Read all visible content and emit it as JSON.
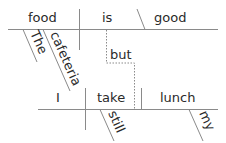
{
  "diagram": {
    "type": "sentence-diagram",
    "clause1": {
      "subject": "food",
      "verb": "is",
      "complement": "good",
      "modifiers": [
        "The",
        "cafeteria"
      ]
    },
    "conjunction": "but",
    "clause2": {
      "subject": "I",
      "verb": "take",
      "object": "lunch",
      "verb_modifier": "still",
      "object_modifier": "my"
    }
  }
}
